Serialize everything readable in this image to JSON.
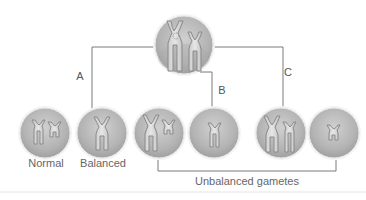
{
  "diagram": {
    "colors": {
      "line": "#7a7a7a",
      "circle_fill": "#bdbdbd",
      "circle_edge": "#f2f2f2",
      "chromosome_fill": "#d4d4d4",
      "chromosome_stroke": "#8a8a8a",
      "text": "#555555"
    },
    "parent_cell": {
      "label": "",
      "chromosomes": 2
    },
    "paths": [
      {
        "id": "A",
        "label": "A"
      },
      {
        "id": "B",
        "label": "B"
      },
      {
        "id": "C",
        "label": "C"
      }
    ],
    "gametes": [
      {
        "label": "Normal",
        "path": "A"
      },
      {
        "label": "Balanced",
        "path": "A"
      },
      {
        "label": "",
        "path": "B"
      },
      {
        "label": "",
        "path": "B"
      },
      {
        "label": "",
        "path": "C"
      },
      {
        "label": "",
        "path": "C"
      }
    ],
    "group_label": "Unbalanced gametes"
  }
}
